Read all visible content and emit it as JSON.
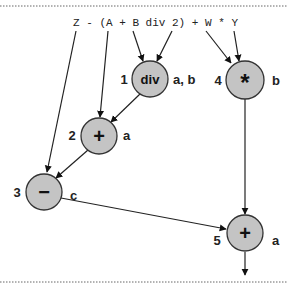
{
  "expression": {
    "text": "Z - (A + B div 2) + W * Y",
    "tokens": [
      "Z",
      "A",
      "B",
      "2",
      "W",
      "Y"
    ]
  },
  "nodes": [
    {
      "id": 1,
      "order": "1",
      "op": "div",
      "regs": "a, b"
    },
    {
      "id": 2,
      "order": "2",
      "op": "+",
      "regs": "a"
    },
    {
      "id": 3,
      "order": "3",
      "op": "−",
      "regs": "c"
    },
    {
      "id": 4,
      "order": "4",
      "op": "*",
      "regs": "b"
    },
    {
      "id": 5,
      "order": "5",
      "op": "+",
      "regs": "a"
    }
  ],
  "edges": [
    {
      "from": "Z",
      "to": "3"
    },
    {
      "from": "A",
      "to": "2"
    },
    {
      "from": "B",
      "to": "1"
    },
    {
      "from": "2 (literal)",
      "to": "1"
    },
    {
      "from": "W",
      "to": "4"
    },
    {
      "from": "Y",
      "to": "4"
    },
    {
      "from": "1",
      "to": "2"
    },
    {
      "from": "2",
      "to": "3"
    },
    {
      "from": "3",
      "to": "5"
    },
    {
      "from": "4",
      "to": "5"
    },
    {
      "from": "5",
      "to": "output"
    }
  ],
  "colors": {
    "node_fill": "#c4c4c4",
    "node_stroke": "#333333",
    "edge": "#222222"
  }
}
